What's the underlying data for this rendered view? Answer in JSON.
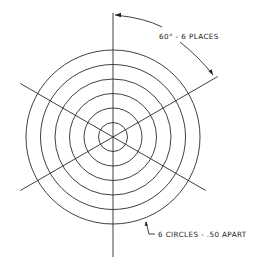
{
  "drawing": {
    "type": "polar grid detail",
    "circle_count": 6,
    "circle_spacing": ".50",
    "radial_line_count": 3,
    "angle_between_lines_deg": 60,
    "line_color": "#2a2a2a"
  },
  "annotations": {
    "angle_note": "60° - 6 PLACES",
    "circle_note": "6 CIRCLES - .50 APART"
  }
}
